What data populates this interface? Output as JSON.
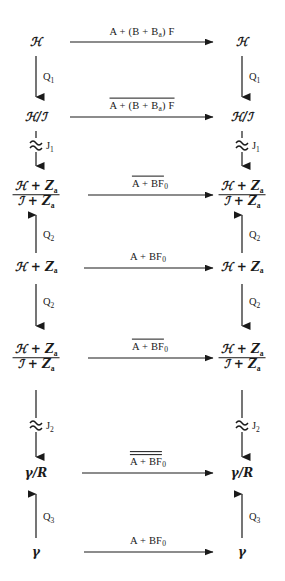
{
  "page": {
    "folio": "",
    "ink_color": "#1a1a1a",
    "background_color": "#ffffff"
  },
  "symbols": {
    "Y": "ℒ",
    "J": "ℐ",
    "Za": "Ζ",
    "V": "γ",
    "approx": "≈"
  },
  "rows": [
    {
      "id": "row-1",
      "object_left": {
        "kind": "plain",
        "text": "ℋ"
      },
      "object_right": {
        "kind": "plain",
        "text": "ℋ"
      },
      "arrow": {
        "label_main": "A + (B + B",
        "label_sub": "a",
        "label_tail": ") F",
        "overlines": 0,
        "direction": "right"
      }
    },
    {
      "id": "row-2",
      "object_left": {
        "kind": "inline-quotient",
        "numerator": "ℋ",
        "denominator": "ℐ"
      },
      "object_right": {
        "kind": "inline-quotient",
        "numerator": "ℋ",
        "denominator": "ℐ"
      },
      "arrow": {
        "label_main": "A + (B + B",
        "label_sub": "a",
        "label_tail": ") F",
        "overlines": 1,
        "direction": "right"
      }
    },
    {
      "id": "row-3",
      "object_left": {
        "kind": "stacked-quotient",
        "numerator": "ℋ + Ζ",
        "numerator_sub": "a",
        "denominator": "ℐ + Ζ",
        "denominator_sub": "a"
      },
      "object_right": {
        "kind": "stacked-quotient",
        "numerator": "ℋ + Ζ",
        "numerator_sub": "a",
        "denominator": "ℐ + Ζ",
        "denominator_sub": "a"
      },
      "arrow": {
        "label_main": "A + BF",
        "label_sub": "0",
        "label_tail": "",
        "overlines": 1,
        "direction": "right"
      }
    },
    {
      "id": "row-4",
      "object_left": {
        "kind": "sum",
        "text": "ℋ + Ζ",
        "sub": "a"
      },
      "object_right": {
        "kind": "sum",
        "text": "ℋ + Ζ",
        "sub": "a"
      },
      "arrow": {
        "label_main": "A + BF",
        "label_sub": "0",
        "label_tail": "",
        "overlines": 0,
        "direction": "right"
      }
    },
    {
      "id": "row-5",
      "object_left": {
        "kind": "stacked-quotient",
        "numerator": "ℋ + Ζ",
        "numerator_sub": "a",
        "denominator": "ℐ + Ζ",
        "denominator_sub": "a"
      },
      "object_right": {
        "kind": "stacked-quotient",
        "numerator": "ℋ + Ζ",
        "numerator_sub": "a",
        "denominator": "ℐ + Ζ",
        "denominator_sub": "a"
      },
      "arrow": {
        "label_main": "A + BF",
        "label_sub": "0",
        "label_tail": "",
        "overlines": 1,
        "direction": "right"
      }
    },
    {
      "id": "row-6",
      "object_left": {
        "kind": "inline-quotient",
        "numerator": "γ",
        "denominator": "R"
      },
      "object_right": {
        "kind": "inline-quotient",
        "numerator": "γ",
        "denominator": "R"
      },
      "arrow": {
        "label_main": "A + BF",
        "label_sub": "0",
        "label_tail": "",
        "overlines": 2,
        "direction": "right"
      }
    },
    {
      "id": "row-7",
      "object_left": {
        "kind": "plain",
        "text": "γ"
      },
      "object_right": {
        "kind": "plain",
        "text": "γ"
      },
      "arrow": {
        "label_main": "A + BF",
        "label_sub": "0",
        "label_tail": "",
        "overlines": 0,
        "direction": "right"
      }
    }
  ],
  "vertical_maps": [
    {
      "id": "vmap-1",
      "from_row": 1,
      "to_row": 2,
      "label": "Q",
      "label_sub": "1",
      "direction": "down",
      "style": "plain"
    },
    {
      "id": "vmap-2",
      "from_row": 2,
      "to_row": 3,
      "label": "J",
      "label_sub": "1",
      "direction": "down",
      "style": "approx"
    },
    {
      "id": "vmap-3",
      "from_row": 4,
      "to_row": 3,
      "label": "Q",
      "label_sub": "2",
      "direction": "up",
      "style": "plain"
    },
    {
      "id": "vmap-4",
      "from_row": 4,
      "to_row": 5,
      "label": "Q",
      "label_sub": "2",
      "direction": "down",
      "style": "plain"
    },
    {
      "id": "vmap-5",
      "from_row": 5,
      "to_row": 6,
      "label": "J",
      "label_sub": "2",
      "direction": "down",
      "style": "approx"
    },
    {
      "id": "vmap-6",
      "from_row": 7,
      "to_row": 6,
      "label": "Q",
      "label_sub": "3",
      "direction": "up",
      "style": "plain"
    }
  ]
}
